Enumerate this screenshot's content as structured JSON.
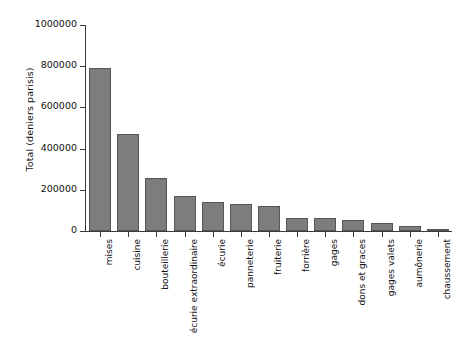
{
  "chart_data": {
    "type": "bar",
    "title": "",
    "xlabel": "",
    "ylabel": "Total (deniers parisis)",
    "ylim": [
      0,
      1000000
    ],
    "ytick_labels": [
      "0",
      "200000",
      "400000",
      "600000",
      "800000",
      "1000000"
    ],
    "ytick_values": [
      0,
      200000,
      400000,
      600000,
      800000,
      1000000
    ],
    "grid": false,
    "legend": "none",
    "bar_color": "#7d7d7d",
    "bar_edge_color": "#555555",
    "axis_color": "#3a3a3a",
    "categories": [
      "mises",
      "cuisine",
      "bouteillerie",
      "écurie extraordinaire",
      "écurie",
      "panneterie",
      "fruiterie",
      "forrière",
      "gages",
      "dons et graces",
      "gages valets",
      "aumônerie",
      "chaussement"
    ],
    "values": [
      793000,
      473000,
      255000,
      171000,
      143000,
      133000,
      120000,
      63000,
      62000,
      52000,
      38000,
      22000,
      5000
    ]
  }
}
